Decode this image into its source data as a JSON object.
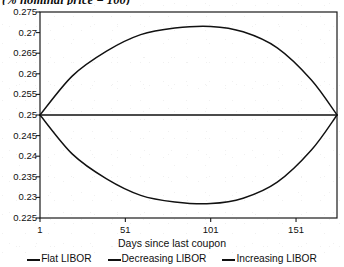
{
  "chart_data": {
    "type": "line",
    "title": "(% nominal price = 100)",
    "xlabel": "Days since last coupon",
    "ylabel": "",
    "xlim": [
      1,
      175
    ],
    "ylim": [
      0.225,
      0.275
    ],
    "grid": false,
    "legend_position": "bottom",
    "xticks": [
      "1",
      "51",
      "101",
      "151"
    ],
    "xtick_values": [
      1,
      51,
      101,
      151
    ],
    "yticks": [
      "0.225",
      "0.23",
      "0.235",
      "0.24",
      "0.245",
      "0.25",
      "0.255",
      "0.26",
      "0.265",
      "0.27",
      "0.275"
    ],
    "ytick_values": [
      0.225,
      0.23,
      0.235,
      0.24,
      0.245,
      0.25,
      0.255,
      0.26,
      0.265,
      0.27,
      0.275
    ],
    "x": [
      1,
      20,
      40,
      60,
      80,
      101,
      120,
      140,
      160,
      175
    ],
    "series": [
      {
        "name": "Flat LIBOR",
        "values": [
          0.25,
          0.25,
          0.25,
          0.25,
          0.25,
          0.25,
          0.25,
          0.25,
          0.25,
          0.25
        ]
      },
      {
        "name": "Decreasing LIBOR",
        "values": [
          0.25,
          0.2405,
          0.2345,
          0.2305,
          0.2289,
          0.2285,
          0.2298,
          0.2337,
          0.2415,
          0.25
        ]
      },
      {
        "name": "Increasing LIBOR",
        "values": [
          0.25,
          0.2595,
          0.2655,
          0.2695,
          0.2711,
          0.2715,
          0.2702,
          0.2663,
          0.2585,
          0.25
        ]
      }
    ]
  },
  "legend": {
    "entries": [
      {
        "label": "Flat LIBOR"
      },
      {
        "label": "Decreasing LIBOR"
      },
      {
        "label": "Increasing LIBOR"
      }
    ]
  },
  "style": {
    "line_color": "#111111",
    "axis_color": "#1a1a1a",
    "background": "#ffffff"
  }
}
